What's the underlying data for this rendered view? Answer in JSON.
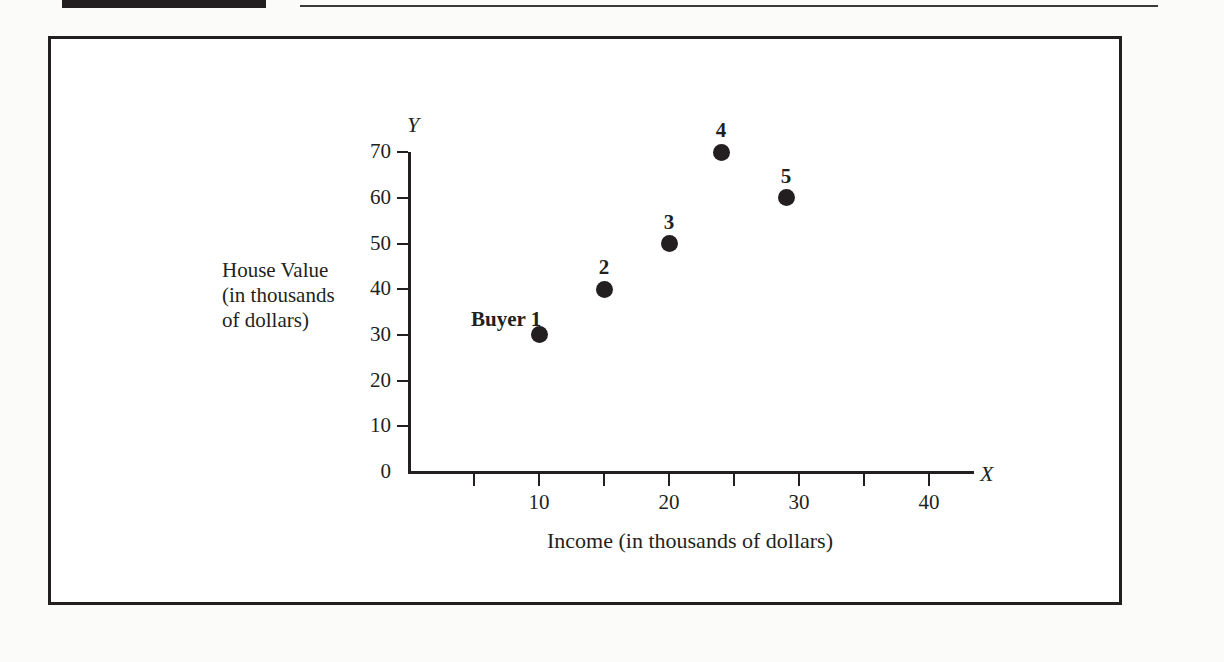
{
  "page": {
    "background_color": "#fbfbfa",
    "ink_color": "#231f20",
    "header_block_label": "",
    "header_rule_label": ""
  },
  "figure": {
    "frame_color": "#231f20"
  },
  "chart_data": {
    "type": "scatter",
    "title": "",
    "xlabel": "Income (in thousands of dollars)",
    "ylabel": "House Value\n(in thousands\nof dollars)",
    "ylabel_lines": [
      "House Value",
      "(in thousands",
      "of dollars)"
    ],
    "x_axis_name": "X",
    "y_axis_name": "Y",
    "xlim": [
      0,
      45
    ],
    "ylim": [
      0,
      75
    ],
    "x_ticks": [
      5,
      10,
      15,
      20,
      25,
      30,
      35,
      40
    ],
    "x_tick_labels": [
      "",
      "10",
      "",
      "20",
      "",
      "30",
      "",
      "40"
    ],
    "y_ticks": [
      0,
      10,
      20,
      30,
      40,
      50,
      60,
      70
    ],
    "y_tick_labels": [
      "0",
      "10",
      "20",
      "30",
      "40",
      "50",
      "60",
      "70"
    ],
    "grid": false,
    "legend": false,
    "marker_color": "#231f20",
    "points": [
      {
        "label": "Buyer 1",
        "x": 10,
        "y": 30,
        "label_position": "left"
      },
      {
        "label": "2",
        "x": 15,
        "y": 40,
        "label_position": "above"
      },
      {
        "label": "3",
        "x": 20,
        "y": 50,
        "label_position": "above"
      },
      {
        "label": "4",
        "x": 24,
        "y": 70,
        "label_position": "above"
      },
      {
        "label": "5",
        "x": 29,
        "y": 60,
        "label_position": "above"
      }
    ]
  }
}
